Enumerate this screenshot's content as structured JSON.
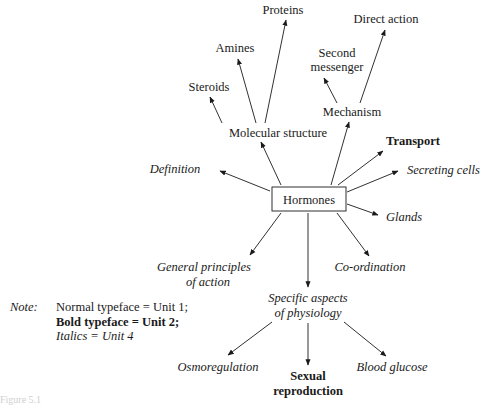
{
  "diagram": {
    "center": {
      "label": "Hormones",
      "style": "normal",
      "boxed": true
    },
    "nodes": [
      {
        "id": "proteins",
        "label": "Proteins",
        "style": "normal"
      },
      {
        "id": "direct_action",
        "label": "Direct action",
        "style": "normal"
      },
      {
        "id": "amines",
        "label": "Amines",
        "style": "normal"
      },
      {
        "id": "second_messenger",
        "label_lines": [
          "Second",
          "messenger"
        ],
        "style": "normal"
      },
      {
        "id": "steroids",
        "label": "Steroids",
        "style": "normal"
      },
      {
        "id": "mechanism",
        "label": "Mechanism",
        "style": "normal"
      },
      {
        "id": "molecular_structure",
        "label": "Molecular structure",
        "style": "normal"
      },
      {
        "id": "transport",
        "label": "Transport",
        "style": "bold"
      },
      {
        "id": "definition",
        "label": "Definition",
        "style": "italic"
      },
      {
        "id": "secreting_cells",
        "label": "Secreting cells",
        "style": "italic"
      },
      {
        "id": "glands",
        "label": "Glands",
        "style": "italic"
      },
      {
        "id": "general_principles",
        "label_lines": [
          "General principles",
          "of action"
        ],
        "style": "italic"
      },
      {
        "id": "coordination",
        "label": "Co-ordination",
        "style": "italic"
      },
      {
        "id": "specific_aspects",
        "label_lines": [
          "Specific aspects",
          "of physiology"
        ],
        "style": "italic"
      },
      {
        "id": "osmoregulation",
        "label": "Osmoregulation",
        "style": "italic"
      },
      {
        "id": "sexual_reproduction",
        "label_lines": [
          "Sexual",
          "reproduction"
        ],
        "style": "bold"
      },
      {
        "id": "blood_glucose",
        "label": "Blood glucose",
        "style": "italic"
      }
    ],
    "edges": [
      [
        "Hormones",
        "Molecular structure"
      ],
      [
        "Hormones",
        "Mechanism"
      ],
      [
        "Hormones",
        "Transport"
      ],
      [
        "Hormones",
        "Secreting cells"
      ],
      [
        "Hormones",
        "Glands"
      ],
      [
        "Hormones",
        "Definition"
      ],
      [
        "Hormones",
        "General principles of action"
      ],
      [
        "Hormones",
        "Specific aspects of physiology"
      ],
      [
        "Hormones",
        "Co-ordination"
      ],
      [
        "Molecular structure",
        "Steroids"
      ],
      [
        "Molecular structure",
        "Amines"
      ],
      [
        "Molecular structure",
        "Proteins"
      ],
      [
        "Mechanism",
        "Second messenger"
      ],
      [
        "Mechanism",
        "Direct action"
      ],
      [
        "Specific aspects of physiology",
        "Osmoregulation"
      ],
      [
        "Specific aspects of physiology",
        "Sexual reproduction"
      ],
      [
        "Specific aspects of physiology",
        "Blood glucose"
      ]
    ]
  },
  "note": {
    "key": "Note:",
    "lines": [
      {
        "text": "Normal typeface = Unit 1;",
        "style": "normal"
      },
      {
        "text": "Bold typeface = Unit 2;",
        "style": "bold"
      },
      {
        "text": "Italics = Unit 4",
        "style": "italic"
      }
    ]
  },
  "caption": {
    "text": "Figure 5.1"
  }
}
